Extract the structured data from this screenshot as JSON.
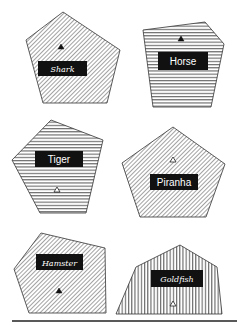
{
  "canvas": {
    "width": 237,
    "height": 325,
    "background": "#ffffff"
  },
  "colors": {
    "stroke": "#333333",
    "hatch": "#555555",
    "label_bg": "#111111",
    "label_text": "#ffffff",
    "baseline": "#222222"
  },
  "shapes": [
    {
      "name": "Shark",
      "label": "Shark",
      "font_style": "script",
      "pattern": "diagonal",
      "points": "63,12 120,50 107,103 43,103 26,40",
      "label_box": {
        "x": 38,
        "y": 61,
        "w": 49,
        "h": 15
      },
      "marker": {
        "type": "filled-triangle",
        "x": 61,
        "y": 47
      }
    },
    {
      "name": "Horse",
      "label": "Horse",
      "font_style": "sans",
      "pattern": "horizontal",
      "points": "143,30 205,22 224,44 211,107 153,107",
      "label_box": {
        "x": 158,
        "y": 52,
        "w": 50,
        "h": 18
      },
      "marker": {
        "type": "filled-triangle",
        "x": 181,
        "y": 39
      }
    },
    {
      "name": "Tiger",
      "label": "Tiger",
      "font_style": "sans",
      "pattern": "horizontal",
      "points": "51,120 103,140 86,213 40,213 12,160",
      "label_box": {
        "x": 35,
        "y": 151,
        "w": 48,
        "h": 16
      },
      "marker": {
        "type": "outline-triangle",
        "x": 57,
        "y": 190
      }
    },
    {
      "name": "Piranha",
      "label": "Piranha",
      "font_style": "sans",
      "pattern": "diagonal",
      "points": "173,127 225,164 206,217 140,217 122,163",
      "label_box": {
        "x": 150,
        "y": 174,
        "w": 48,
        "h": 16
      },
      "marker": {
        "type": "outline-triangle",
        "x": 173,
        "y": 160
      }
    },
    {
      "name": "Hamster",
      "label": "Hamster",
      "font_style": "script",
      "pattern": "diagonal",
      "points": "41,233 105,248 106,313 29,313 14,269",
      "label_box": {
        "x": 36,
        "y": 254,
        "w": 47,
        "h": 16
      },
      "marker": {
        "type": "filled-triangle",
        "x": 59,
        "y": 291
      }
    },
    {
      "name": "Goldfish",
      "label": "Goldfish",
      "font_style": "script",
      "pattern": "vertical",
      "points": "180,245 217,267 222,314 116,314 136,267",
      "label_box": {
        "x": 151,
        "y": 270,
        "w": 52,
        "h": 17
      },
      "marker": {
        "type": "outline-triangle",
        "x": 173,
        "y": 304
      }
    }
  ],
  "baseline": {
    "x1": 12,
    "y1": 321,
    "x2": 237,
    "y2": 321
  }
}
